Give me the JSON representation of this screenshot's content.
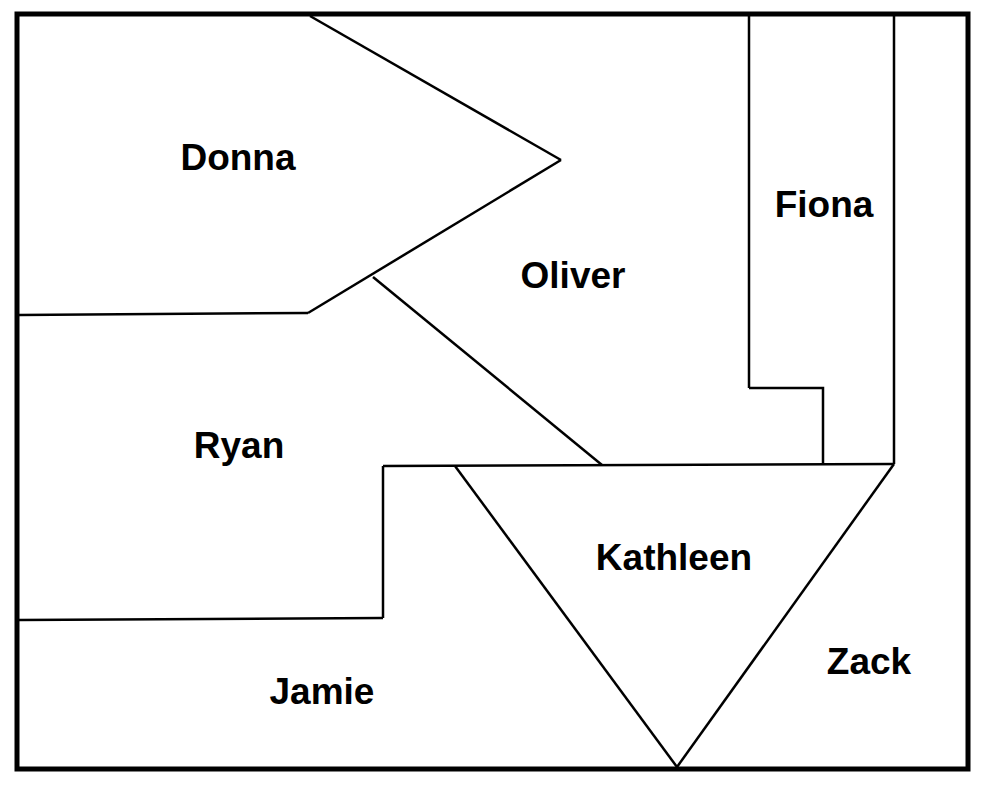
{
  "diagram": {
    "type": "region-map",
    "frame": {
      "x1": 17,
      "y1": 14,
      "x2": 968,
      "y2": 769,
      "stroke_width": 5
    },
    "line_color": "#000000",
    "background": "#ffffff",
    "regions": [
      {
        "name": "Donna",
        "label": "Donna",
        "label_x": 238,
        "label_y": 157
      },
      {
        "name": "Oliver",
        "label": "Oliver",
        "label_x": 573,
        "label_y": 275
      },
      {
        "name": "Fiona",
        "label": "Fiona",
        "label_x": 824,
        "label_y": 204
      },
      {
        "name": "Ryan",
        "label": "Ryan",
        "label_x": 239,
        "label_y": 445
      },
      {
        "name": "Kathleen",
        "label": "Kathleen",
        "label_x": 674,
        "label_y": 557
      },
      {
        "name": "Zack",
        "label": "Zack",
        "label_x": 869,
        "label_y": 661
      },
      {
        "name": "Jamie",
        "label": "Jamie",
        "label_x": 322,
        "label_y": 691
      }
    ],
    "lines": [
      {
        "id": "donna-top-diag",
        "points": "310,16 561,160"
      },
      {
        "id": "donna-bottom-diag",
        "points": "561,160 308,313"
      },
      {
        "id": "donna-bottom",
        "points": "308,313 19,315"
      },
      {
        "id": "oliver-ryan-diag",
        "points": "373,277 602,465"
      },
      {
        "id": "fiona-left",
        "points": "749,16 749,388"
      },
      {
        "id": "fiona-step",
        "points": "749,388 823,388 823,464"
      },
      {
        "id": "fiona-right",
        "points": "894,16 894,464"
      },
      {
        "id": "mid-horizontal",
        "points": "383,466 894,464"
      },
      {
        "id": "ryan-right-step",
        "points": "383,466 383,618"
      },
      {
        "id": "ryan-jamie-border",
        "points": "383,618 19,620"
      },
      {
        "id": "kathleen-left",
        "points": "455,466 677,767"
      },
      {
        "id": "kathleen-right",
        "points": "894,464 677,767"
      }
    ]
  }
}
